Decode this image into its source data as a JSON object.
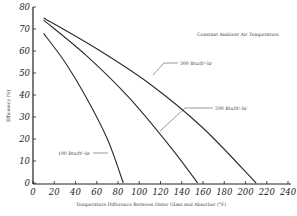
{
  "chart_data": {
    "type": "line",
    "title": "Constant Ambient Air Temperature",
    "xlabel": "Temperature Difference Between Outer Glass and Absorber (°F)",
    "ylabel": "Efficiency (%)",
    "xlim": [
      0,
      240
    ],
    "ylim": [
      0,
      80
    ],
    "x_ticks": [
      "0",
      "20",
      "40",
      "60",
      "80",
      "100",
      "120",
      "140",
      "160",
      "180",
      "200",
      "220",
      "240"
    ],
    "y_ticks": [
      "0",
      "10",
      "20",
      "30",
      "40",
      "50",
      "60",
      "70",
      "80"
    ],
    "grid": false,
    "legend": "inline annotations with leader lines",
    "series": [
      {
        "name": "300 Btu/ft²-hr",
        "x": [
          10,
          60,
          110,
          160,
          210
        ],
        "y": [
          75,
          61,
          45,
          25,
          0
        ]
      },
      {
        "name": "200 Btu/ft²-hr",
        "x": [
          10,
          50,
          90,
          130,
          155
        ],
        "y": [
          74,
          58,
          39,
          16,
          0
        ]
      },
      {
        "name": "100 Btu/ft²-hr",
        "x": [
          10,
          30,
          50,
          70,
          85
        ],
        "y": [
          68,
          55,
          39,
          20,
          0
        ]
      }
    ]
  },
  "labels": {
    "title": "Constant Ambient Air Temperature",
    "xlabel": "Temperature Difference Between Outer Glass and Absorber (°F)",
    "ylabel": "Efficiency (%)",
    "s300": "300 Btu/ft²-hr",
    "s200": "200 Btu/ft²-hr",
    "s100": "100 Btu/ft²-hr"
  },
  "ticks": {
    "x": [
      "0",
      "20",
      "40",
      "60",
      "80",
      "100",
      "120",
      "140",
      "160",
      "180",
      "200",
      "220",
      "240"
    ],
    "y": [
      "0",
      "10",
      "20",
      "30",
      "40",
      "50",
      "60",
      "70",
      "80"
    ]
  }
}
